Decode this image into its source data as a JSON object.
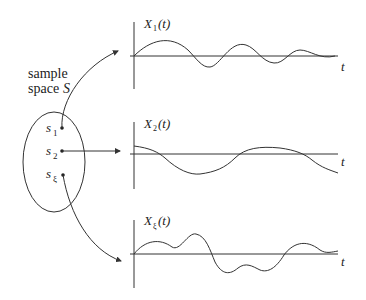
{
  "sample_space": {
    "label_line1": "sample",
    "label_line2": "space",
    "set_symbol": "S",
    "points": [
      {
        "name": "s",
        "sub": "1"
      },
      {
        "name": "s",
        "sub": "2"
      },
      {
        "name": "s",
        "sub": "ξ"
      }
    ]
  },
  "plots": [
    {
      "label_base": "X",
      "label_sub": "1",
      "label_arg": "(t)",
      "axis": "t"
    },
    {
      "label_base": "X",
      "label_sub": "2",
      "label_arg": "(t)",
      "axis": "t"
    },
    {
      "label_base": "X",
      "label_sub": "ξ",
      "label_arg": "(t)",
      "axis": "t"
    }
  ],
  "colors": {
    "line": "#333333",
    "text": "#222222",
    "background": "#ffffff"
  }
}
